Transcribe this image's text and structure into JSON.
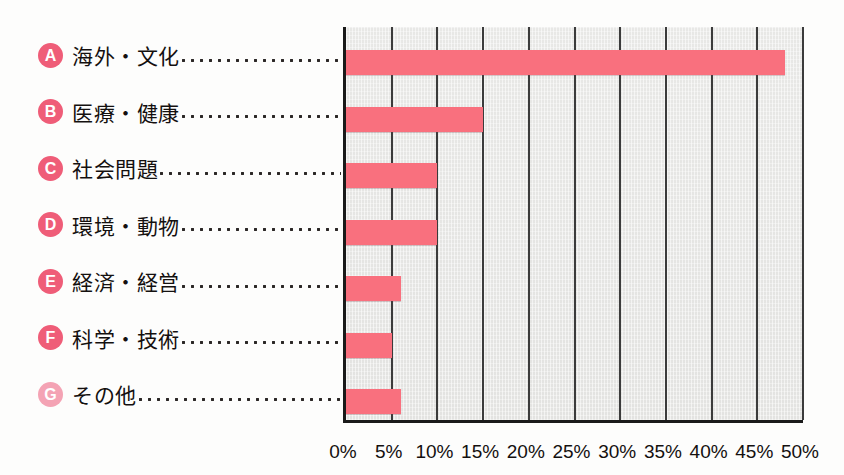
{
  "chart_data": {
    "type": "bar",
    "orientation": "horizontal",
    "title": "",
    "subtitle": "",
    "xlabel": "",
    "ylabel": "",
    "xlim": [
      0,
      50
    ],
    "xtick_step": 5,
    "xtick_labels": [
      "0%",
      "5%",
      "10%",
      "15%",
      "20%",
      "25%",
      "30%",
      "35%",
      "40%",
      "45%",
      "50%"
    ],
    "xtick_values": [
      0,
      5,
      10,
      15,
      20,
      25,
      30,
      35,
      40,
      45,
      50
    ],
    "grid": "vertical",
    "legend": "none",
    "units": "percent",
    "bar_color": "#f9707e",
    "plot_background": "#e6e6e4",
    "categories": [
      "海外・文化",
      "医療・健康",
      "社会問題",
      "環境・動物",
      "経済・経営",
      "科学・技術",
      "その他"
    ],
    "values": [
      48,
      15,
      10,
      10,
      6,
      5,
      6
    ],
    "series": [
      {
        "name": "",
        "values": [
          48,
          15,
          10,
          10,
          6,
          5,
          6
        ]
      }
    ]
  },
  "labels": {
    "rows": [
      {
        "badge": "A",
        "text": "海外・文化",
        "faded": false
      },
      {
        "badge": "B",
        "text": "医療・健康",
        "faded": false
      },
      {
        "badge": "C",
        "text": "社会問題",
        "faded": false
      },
      {
        "badge": "D",
        "text": "環境・動物",
        "faded": false
      },
      {
        "badge": "E",
        "text": "経済・経営",
        "faded": false
      },
      {
        "badge": "F",
        "text": "科学・技術",
        "faded": false
      },
      {
        "badge": "G",
        "text": "その他",
        "faded": true
      }
    ]
  },
  "colors": {
    "bar": "#f9707e",
    "badge": "#ef5d78",
    "badge_faded": "#f4a3b4",
    "axis": "#1a1a1a",
    "gridline": "#3b3b3b",
    "plot_bg": "#e6e6e4",
    "text": "#14100f"
  }
}
